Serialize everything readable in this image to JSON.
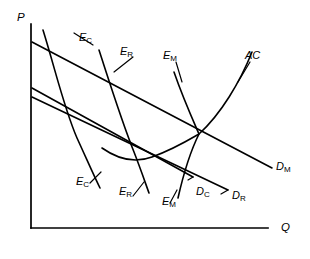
{
  "figure": {
    "type": "economics-diagram"
  },
  "axes": {
    "y_label": "P",
    "x_label": "Q"
  },
  "curves": {
    "ac": {
      "label": "AC",
      "sub": ""
    },
    "demand_m": {
      "label": "D",
      "sub": "M"
    },
    "demand_c": {
      "label": "D",
      "sub": "C"
    },
    "demand_r": {
      "label": "D",
      "sub": "R"
    },
    "equilibrium_c": {
      "label": "E",
      "sub": "C"
    },
    "equilibrium_r": {
      "label": "E",
      "sub": "R"
    },
    "equilibrium_m": {
      "label": "E",
      "sub": "M"
    }
  },
  "labels": {
    "ec_top": {
      "main": "E",
      "sub": "C"
    },
    "er_top": {
      "main": "E",
      "sub": "R"
    },
    "em_top": {
      "main": "E",
      "sub": "M"
    },
    "ac_top": {
      "main": "AC",
      "sub": ""
    },
    "dm_right": {
      "main": "D",
      "sub": "M"
    },
    "dc_bottom": {
      "main": "D",
      "sub": "C"
    },
    "dr_bottom": {
      "main": "D",
      "sub": "R"
    },
    "ec_bottom": {
      "main": "E",
      "sub": "C"
    },
    "er_bottom": {
      "main": "E",
      "sub": "R"
    },
    "em_bottom": {
      "main": "E",
      "sub": "M"
    },
    "p_axis": {
      "main": "P",
      "sub": ""
    },
    "q_axis": {
      "main": "Q",
      "sub": ""
    }
  },
  "colors": {
    "ink": "#000000",
    "background": "#ffffff"
  }
}
